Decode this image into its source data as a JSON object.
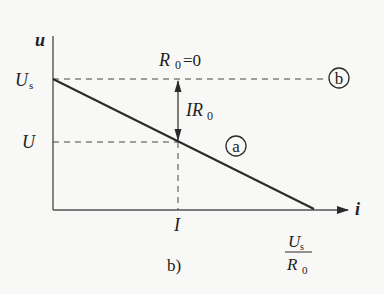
{
  "figure": {
    "caption": "b)",
    "axes": {
      "y_label": "u",
      "x_label": "i"
    },
    "labels": {
      "us": {
        "main": "U",
        "sub": "s"
      },
      "u": "U",
      "i": "I",
      "r0_zero": {
        "main": "R",
        "sub": "0",
        "suffix": "=0"
      },
      "ir0": {
        "main": "IR",
        "sub": "0"
      },
      "intercept": {
        "num_main": "U",
        "num_sub": "s",
        "den_main": "R",
        "den_sub": "0"
      }
    },
    "curves": {
      "a": {
        "label": "a",
        "description": "real source: u = Us - I·R0"
      },
      "b": {
        "label": "b",
        "description": "ideal source: R0=0, u = Us"
      }
    },
    "colors": {
      "line": "#2a2a2a",
      "axis": "#555555",
      "dashed": "#444444",
      "background": "#f8f8f6"
    }
  }
}
